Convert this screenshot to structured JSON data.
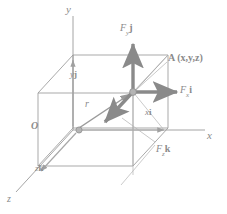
{
  "figure": {
    "colors": {
      "line": "#8d8d8d",
      "arrow": "#8a8a8a",
      "thin_line": "#a8a8a8",
      "label": "#8a8a8a",
      "background": "#ffffff",
      "node": "#b0b0b0"
    },
    "axes": [
      {
        "id": "y-axis",
        "label": "y",
        "label_x": 66,
        "label_y": 5
      },
      {
        "id": "x-axis",
        "label": "x",
        "label_x": 208,
        "label_y": 130
      },
      {
        "id": "z-axis",
        "label": "z",
        "label_x": 8,
        "label_y": 197
      }
    ],
    "points": [
      {
        "id": "origin",
        "label": "O",
        "label_x": 32,
        "label_y": 124,
        "cx": 79,
        "cy": 130
      },
      {
        "id": "point-a",
        "label": "A (x,y,z)",
        "label_x": 170,
        "label_y": 57,
        "cx": 133,
        "cy": 92
      }
    ],
    "vectors": [
      {
        "id": "force-y",
        "label_main": "F",
        "label_sub": "y",
        "label_unit": "j",
        "label_x": 121,
        "label_y": 25
      },
      {
        "id": "force-x",
        "label_main": "F",
        "label_sub": "x",
        "label_unit": "i",
        "label_x": 181,
        "label_y": 87
      },
      {
        "id": "force-z",
        "label_main": "F",
        "label_sub": "z",
        "label_unit": "k",
        "label_x": 157,
        "label_y": 147
      },
      {
        "id": "position-vector",
        "label_main": "r",
        "label_x": 86,
        "label_y": 101
      },
      {
        "id": "component-x",
        "label_main": "x",
        "label_unit": "i",
        "label_x": 146,
        "label_y": 110
      },
      {
        "id": "component-y",
        "label_main": "y",
        "label_unit": "j",
        "label_x": 71,
        "label_y": 72
      },
      {
        "id": "component-z",
        "label_main": "z",
        "label_unit": "k",
        "label_x": 36,
        "label_y": 166
      }
    ]
  }
}
